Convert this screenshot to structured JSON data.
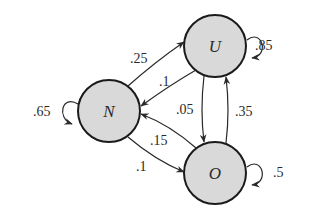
{
  "diagram": {
    "type": "markov-chain",
    "nodes": [
      {
        "id": "N",
        "label": "N"
      },
      {
        "id": "U",
        "label": "U"
      },
      {
        "id": "O",
        "label": "O"
      }
    ],
    "edges": [
      {
        "from": "N",
        "to": "N",
        "label": ".65"
      },
      {
        "from": "N",
        "to": "U",
        "label": ".25"
      },
      {
        "from": "U",
        "to": "N",
        "label": ".1"
      },
      {
        "from": "U",
        "to": "U",
        "label": ".85"
      },
      {
        "from": "U",
        "to": "O",
        "label": ".05"
      },
      {
        "from": "O",
        "to": "U",
        "label": ".35"
      },
      {
        "from": "O",
        "to": "N",
        "label": ".15"
      },
      {
        "from": "N",
        "to": "O",
        "label": ".1"
      },
      {
        "from": "O",
        "to": "O",
        "label": ".5"
      }
    ],
    "colors": {
      "node_fill": "#d9d9d9",
      "node_stroke": "#1a1a1a",
      "edge": "#2a2a2a"
    }
  }
}
